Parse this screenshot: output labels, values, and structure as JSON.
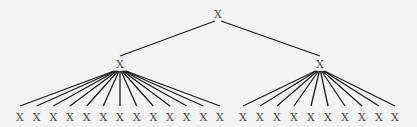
{
  "diagram": {
    "type": "tree",
    "root": {
      "label": "X",
      "x": 218,
      "y": 14
    },
    "children": [
      {
        "label": "X",
        "x": 120,
        "y": 64,
        "leaves": {
          "label": "X",
          "count": 13,
          "y": 117,
          "x": [
            20,
            36.7,
            53.3,
            70,
            86.7,
            103.3,
            120,
            136.7,
            153.3,
            170,
            186.7,
            203.3,
            220
          ]
        }
      },
      {
        "label": "X",
        "x": 320,
        "y": 64,
        "leaves": {
          "label": "X",
          "count": 10,
          "y": 117,
          "x": [
            243,
            260,
            277,
            294,
            311,
            328,
            345,
            362,
            379,
            395
          ]
        }
      }
    ]
  }
}
